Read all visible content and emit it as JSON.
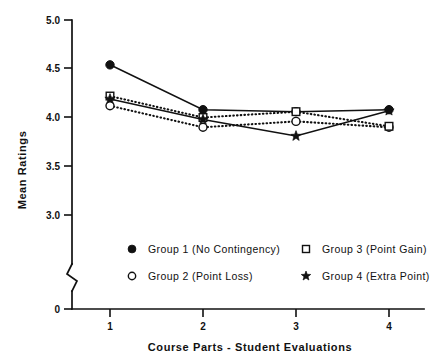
{
  "chart_data": {
    "type": "line",
    "title": "",
    "xlabel": "Course Parts - Student Evaluations",
    "ylabel": "Mean Ratings",
    "categories": [
      "1",
      "2",
      "3",
      "4"
    ],
    "x": [
      1,
      2,
      3,
      4
    ],
    "xlim": [
      1,
      4
    ],
    "ylim": [
      3.0,
      5.0
    ],
    "yticks": [
      "5.0",
      "4.5",
      "4.0",
      "3.5",
      "3.0",
      "0"
    ],
    "ytick_values": [
      5.0,
      4.5,
      4.0,
      3.5,
      3.0,
      0
    ],
    "xticks": [
      "1",
      "2",
      "3",
      "4"
    ],
    "axis_break": true,
    "grid": false,
    "legend_position": "below-axes",
    "series": [
      {
        "name": "Group 1 (No Contingency)",
        "short_name": "Group 1",
        "condition": "No Contingency",
        "marker": "filled-circle",
        "line_style": "solid",
        "values": [
          4.54,
          4.08,
          4.06,
          4.08
        ]
      },
      {
        "name": "Group 2 (Point Loss)",
        "short_name": "Group 2",
        "condition": "Point Loss",
        "marker": "open-circle",
        "line_style": "dotted",
        "values": [
          4.12,
          3.9,
          3.96,
          3.9
        ]
      },
      {
        "name": "Group 3 (Point Gain)",
        "short_name": "Group 3",
        "condition": "Point Gain",
        "marker": "open-square",
        "line_style": "dotted",
        "values": [
          4.22,
          4.0,
          4.06,
          3.91
        ]
      },
      {
        "name": "Group 4 (Extra Point)",
        "short_name": "Group 4",
        "condition": "Extra Point",
        "marker": "star",
        "line_style": "solid",
        "values": [
          4.19,
          3.98,
          3.81,
          4.07
        ]
      }
    ]
  },
  "axes": {
    "y_title": "Mean Ratings",
    "x_title": "Course Parts - Student Evaluations",
    "y_tick_labels": [
      "5.0",
      "4.5",
      "4.0",
      "3.5",
      "3.0",
      "0"
    ],
    "x_tick_labels": [
      "1",
      "2",
      "3",
      "4"
    ]
  },
  "legend": {
    "entries": [
      {
        "label": "Group 1 (No Contingency)",
        "marker": "filled-circle"
      },
      {
        "label": "Group 3 (Point Gain)",
        "marker": "open-square"
      },
      {
        "label": "Group 2 (Point Loss)",
        "marker": "open-circle"
      },
      {
        "label": "Group 4 (Extra Point)",
        "marker": "star"
      }
    ]
  },
  "colors": {
    "ink": "#111111",
    "background": "#ffffff"
  }
}
